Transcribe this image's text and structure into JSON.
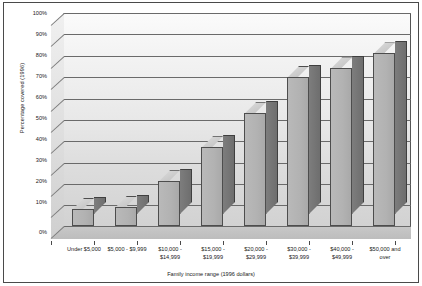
{
  "chart_data": {
    "type": "bar",
    "title": "",
    "subtitle": "",
    "xlabel": "Family income range (1996 dollars)",
    "ylabel": "Percentage covered (1996)",
    "categories": [
      "Under $5,000",
      "$5,000 - $9,999",
      "$10,000 - $14,999",
      "$15,000 - $19,999",
      "$20,000 - $29,999",
      "$30,000 - $39,999",
      "$40,000 - $49,999",
      "$50,000 and over"
    ],
    "category_lines": [
      [
        "Under $5,000"
      ],
      [
        "$5,000 - $9,999"
      ],
      [
        "$10,000 -",
        "$14,999"
      ],
      [
        "$15,000 -",
        "$19,999"
      ],
      [
        "$20,000 -",
        "$29,999"
      ],
      [
        "$30,000 -",
        "$39,999"
      ],
      [
        "$40,000 -",
        "$49,999"
      ],
      [
        "$50,000 and",
        "over"
      ]
    ],
    "values": [
      8,
      9,
      21,
      37,
      53,
      70,
      74,
      81
    ],
    "ylim": [
      0,
      100
    ],
    "ytick_labels": [
      "0%",
      "10%",
      "20%",
      "30%",
      "40%",
      "50%",
      "60%",
      "70%",
      "80%",
      "90%",
      "100%"
    ],
    "ytick_values": [
      0,
      10,
      20,
      30,
      40,
      50,
      60,
      70,
      80,
      90,
      100
    ],
    "grid": true,
    "grid_axis": "y",
    "legend": false,
    "legend_position": "none",
    "style": "3d-column-grayscale",
    "colors": {
      "bar_face": "#b2b2b2",
      "bar_side": "#757575",
      "bar_top": "#cfcfcf",
      "plot_background": "#e6e6e6",
      "gridline": "#6a6a6a",
      "border": "#4a4a4a",
      "text": "#1a1a1a"
    }
  }
}
